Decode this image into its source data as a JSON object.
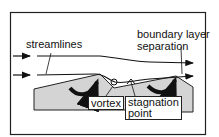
{
  "diagram": {
    "labels": {
      "streamlines": "streamlines",
      "boundary_layer_1": "boundary layer",
      "boundary_layer_2": "separation",
      "vortex": "vortex",
      "stagnation_1": "stagnation",
      "stagnation_2": "point"
    },
    "colors": {
      "dune_fill": "#d4d4d4",
      "line": "#111111",
      "frame": "#222222"
    }
  }
}
